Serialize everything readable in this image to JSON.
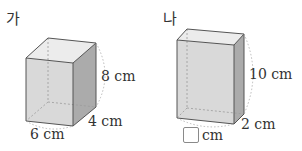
{
  "figures": [
    {
      "id": "ga",
      "label": "가",
      "width_label": "6 cm",
      "depth_label": "4 cm",
      "height_label": "8 cm"
    },
    {
      "id": "na",
      "label": "나",
      "width_label": "cm",
      "width_value": "",
      "depth_label": "2 cm",
      "height_label": "10 cm"
    }
  ],
  "colors": {
    "front_face": "#d6d6d6",
    "top_face": "#e8e8e8",
    "side_face": "#a9a9a9",
    "edge": "#555555",
    "hidden_edge": "#9a9a9a"
  }
}
